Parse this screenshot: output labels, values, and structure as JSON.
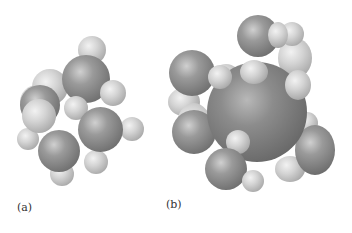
{
  "figure": {
    "panels": [
      {
        "label": "(a)",
        "description": "space-filling molecular model, small cluster"
      },
      {
        "label": "(b)",
        "description": "space-filling molecular model with large central atom"
      }
    ]
  }
}
